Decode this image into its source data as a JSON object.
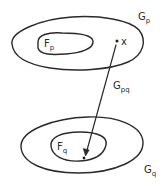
{
  "diagram": {
    "type": "set-mapping-diagram",
    "regions": {
      "outer_top": {
        "label": "G",
        "subscript": "p"
      },
      "inner_top": {
        "label": "F",
        "subscript": "p"
      },
      "outer_bottom": {
        "label": "G",
        "subscript": "q"
      },
      "inner_bottom": {
        "label": "F",
        "subscript": "q"
      }
    },
    "point": {
      "label": "x"
    },
    "mapping": {
      "label": "G",
      "subscript": "pq"
    },
    "colors": {
      "stroke": "#2a2a2a",
      "background": "#ffffff"
    }
  }
}
